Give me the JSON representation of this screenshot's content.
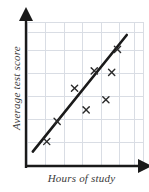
{
  "figure": {
    "kind": "scatter-plot-with-line-of-best-fit",
    "background_color": "#ffffff"
  },
  "labels": {
    "ylabel": "Average test score",
    "xlabel": "Hours of study"
  },
  "chart_data": {
    "type": "scatter",
    "title": "",
    "xlabel": "Hours of study",
    "ylabel": "Average test score",
    "xlim": [
      0,
      10
    ],
    "ylim": [
      0,
      10
    ],
    "grid": true,
    "legend": false,
    "axis_tick_labels": {
      "x": [],
      "y": []
    },
    "marker": "x",
    "marker_color": "#2b2b2b",
    "points": [
      {
        "x": 1.7,
        "y": 1.7
      },
      {
        "x": 2.6,
        "y": 3.1
      },
      {
        "x": 4.1,
        "y": 5.4
      },
      {
        "x": 5.1,
        "y": 3.9
      },
      {
        "x": 5.8,
        "y": 6.6
      },
      {
        "x": 7.3,
        "y": 6.5
      },
      {
        "x": 7.8,
        "y": 8.1
      },
      {
        "x": 6.8,
        "y": 4.6
      }
    ],
    "trend_line": {
      "label": "line of best fit",
      "color": "#1a1a1a",
      "width": 2.6,
      "x_start": 0.5,
      "y_start": 1.0,
      "x_end": 8.6,
      "y_end": 9.1
    },
    "grid_color": "#d9dde4",
    "axis_color": "#1a1a1a",
    "x_gridlines": [
      1.6,
      3.2,
      4.8,
      6.4,
      8.0,
      9.3
    ],
    "y_gridlines": [
      1.6,
      3.2,
      4.8,
      6.4,
      8.0,
      9.3
    ],
    "axes_arrows": {
      "x": true,
      "y": true
    }
  }
}
